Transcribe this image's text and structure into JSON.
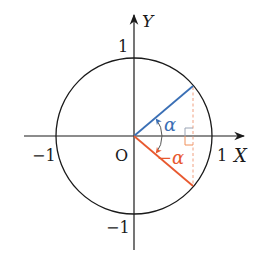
{
  "diagram": {
    "origin_label": "O",
    "axes": {
      "x_label": "X",
      "y_label": "Y",
      "x_ticks": [
        {
          "label": "−1",
          "value": -1
        },
        {
          "label": "1",
          "value": 1
        }
      ],
      "y_ticks": [
        {
          "label": "1",
          "value": 1
        },
        {
          "label": "−1",
          "value": -1
        }
      ]
    },
    "angles": {
      "positive_label": "α",
      "negative_label": "−α",
      "angle_degrees": 33
    },
    "colors": {
      "axis": "#1a1a1a",
      "circle": "#1a1a1a",
      "positive_ray": "#3a6fb5",
      "negative_ray": "#e8592f",
      "dashed_projection": "#f0a080",
      "right_angle_mark_top": "#9aa4b4",
      "right_angle_mark_bottom": "#f0905a"
    },
    "geometry": {
      "center_x": 134,
      "center_y": 136,
      "radius": 78
    }
  }
}
